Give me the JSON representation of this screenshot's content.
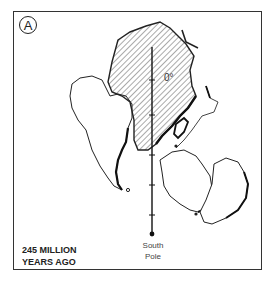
{
  "figure": {
    "panel_label": "A",
    "meridian_label": "0°",
    "pole_label_line1": "South",
    "pole_label_line2": "Pole",
    "age_line1": "245 MILLION",
    "age_line2": "YEARS AGO"
  },
  "colors": {
    "ink": "#222222",
    "background": "#ffffff",
    "hatch": "#555555"
  }
}
